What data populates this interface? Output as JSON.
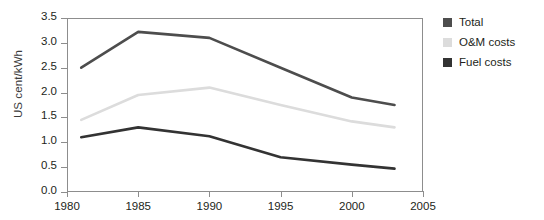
{
  "chart_data": {
    "type": "line",
    "title": "",
    "xlabel": "",
    "ylabel": "US cent/kWh",
    "xlim": [
      1980,
      2005
    ],
    "ylim": [
      0.0,
      3.5
    ],
    "grid": false,
    "legend_position": "right",
    "x": [
      1981,
      1985,
      1990,
      1995,
      2000,
      2003
    ],
    "xticks": [
      "1980",
      "1985",
      "1990",
      "1995",
      "2000",
      "2005"
    ],
    "yticks": [
      "0.0",
      "0.5",
      "1.0",
      "1.5",
      "2.0",
      "2.5",
      "3.0",
      "3.5"
    ],
    "series": [
      {
        "name": "Total",
        "color": "#4d4d4d",
        "values": [
          2.5,
          3.22,
          3.1,
          2.5,
          1.9,
          1.75
        ]
      },
      {
        "name": "O&M costs",
        "color": "#dcdcdc",
        "values": [
          1.45,
          1.95,
          2.1,
          1.75,
          1.42,
          1.3
        ]
      },
      {
        "name": "Fuel costs",
        "color": "#333333",
        "values": [
          1.1,
          1.3,
          1.12,
          0.7,
          0.55,
          0.47
        ]
      }
    ]
  },
  "axis": {
    "y_title": "US cent/kWh",
    "y_ticks": [
      "3.5",
      "3.0",
      "2.5",
      "2.0",
      "1.5",
      "1.0",
      "0.5",
      "0.0"
    ],
    "x_ticks": [
      "1980",
      "1985",
      "1990",
      "1995",
      "2000",
      "2005"
    ]
  },
  "legend": {
    "items": [
      {
        "label": "Total",
        "color": "#4d4d4d"
      },
      {
        "label": "O&M costs",
        "color": "#dcdcdc"
      },
      {
        "label": "Fuel costs",
        "color": "#333333"
      }
    ]
  }
}
